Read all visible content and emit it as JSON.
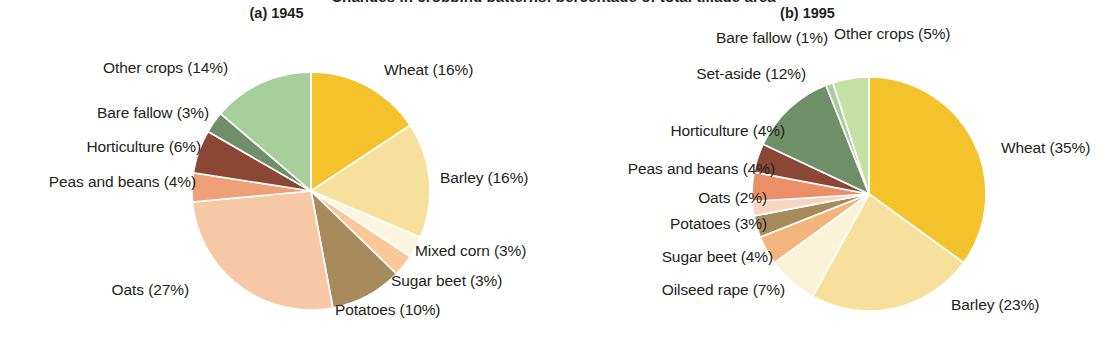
{
  "figure": {
    "clipped_top_text": "Changes in cropping patterns: percentage of total tillage area",
    "background": "#ffffff",
    "text_color": "#231f20"
  },
  "chart_data": [
    {
      "type": "pie",
      "panel_id": "a",
      "title": "(a) 1945",
      "legend": "labels-outside",
      "grid": false,
      "start_angle_deg": 0,
      "direction": "clockwise",
      "categories": [
        "Wheat",
        "Barley",
        "Mixed corn",
        "Sugar beet",
        "Potatoes",
        "Oats",
        "Peas and beans",
        "Horticulture",
        "Bare fallow",
        "Other crops"
      ],
      "values": [
        16,
        16,
        3,
        3,
        10,
        27,
        4,
        6,
        3,
        14
      ],
      "labels": [
        "Wheat (16%)",
        "Barley (16%)",
        "Mixed corn (3%)",
        "Sugar beet (3%)",
        "Potatoes (10%)",
        "Oats (27%)",
        "Peas and beans (4%)",
        "Horticulture (6%)",
        "Bare fallow (3%)",
        "Other crops (14%)"
      ],
      "colors": [
        "#f4c22b",
        "#f7e09b",
        "#fbf5e0",
        "#f9c798",
        "#a88b5c",
        "#f7c8a6",
        "#f0a078",
        "#8b4736",
        "#6f8f68",
        "#a9ce9e"
      ]
    },
    {
      "type": "pie",
      "panel_id": "b",
      "title": "(b) 1995",
      "legend": "labels-outside",
      "grid": false,
      "start_angle_deg": 0,
      "direction": "clockwise",
      "categories": [
        "Wheat",
        "Barley",
        "Oilseed rape",
        "Sugar beet",
        "Potatoes",
        "Oats",
        "Peas and beans",
        "Horticulture",
        "Set-aside",
        "Bare fallow",
        "Other crops"
      ],
      "values": [
        35,
        23,
        7,
        4,
        3,
        2,
        4,
        4,
        12,
        1,
        5
      ],
      "labels": [
        "Wheat (35%)",
        "Barley (23%)",
        "Oilseed rape (7%)",
        "Sugar beet (4%)",
        "Potatoes (3%)",
        "Oats (2%)",
        "Peas and beans (4%)",
        "Horticulture (4%)",
        "Set-aside (12%)",
        "Bare fallow (1%)",
        "Other crops (5%)"
      ],
      "colors": [
        "#f4c22b",
        "#f7e09b",
        "#fbf3d8",
        "#f3b57c",
        "#a88b5c",
        "#f7d5c0",
        "#ea8f68",
        "#8b4736",
        "#6f8f68",
        "#a9ce9e",
        "#c5e0a3"
      ]
    }
  ],
  "panel_a": {
    "title": "(a) 1945",
    "labels": {
      "wheat": "Wheat (16%)",
      "barley": "Barley (16%)",
      "mixed_corn": "Mixed corn (3%)",
      "sugar_beet": "Sugar beet (3%)",
      "potatoes": "Potatoes (10%)",
      "oats": "Oats (27%)",
      "peas_and_beans": "Peas and beans (4%)",
      "horticulture": "Horticulture (6%)",
      "bare_fallow": "Bare fallow (3%)",
      "other_crops": "Other crops (14%)"
    }
  },
  "panel_b": {
    "title": "(b) 1995",
    "labels": {
      "wheat": "Wheat (35%)",
      "barley": "Barley (23%)",
      "oilseed_rape": "Oilseed rape (7%)",
      "sugar_beet": "Sugar beet (4%)",
      "potatoes": "Potatoes (3%)",
      "oats": "Oats (2%)",
      "peas_and_beans": "Peas and beans (4%)",
      "horticulture": "Horticulture (4%)",
      "set_aside": "Set-aside (12%)",
      "bare_fallow": "Bare fallow (1%)",
      "other_crops": "Other crops (5%)"
    }
  },
  "geometry": {
    "pie_a": {
      "cx": 311,
      "cy": 191,
      "r": 119
    },
    "pie_b": {
      "cx": 316,
      "cy": 194,
      "r": 117
    }
  }
}
